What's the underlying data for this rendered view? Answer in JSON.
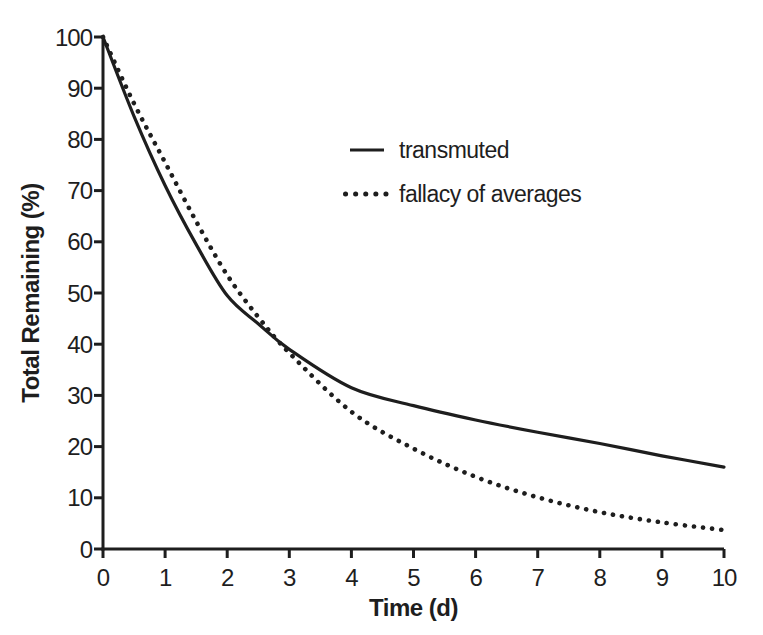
{
  "figure": {
    "background": "#ffffff",
    "ink_color": "#1e1e1e"
  },
  "chart_data": {
    "type": "line",
    "title": "",
    "xlabel": "Time (d)",
    "ylabel": "Total Remaining (%)",
    "xlim": [
      0,
      10
    ],
    "ylim": [
      0,
      100
    ],
    "x_ticks": [
      0,
      1,
      2,
      3,
      4,
      5,
      6,
      7,
      8,
      9,
      10
    ],
    "y_ticks": [
      0,
      10,
      20,
      30,
      40,
      50,
      60,
      70,
      80,
      90,
      100
    ],
    "grid": false,
    "legend_position": "upper-right-inside",
    "series": [
      {
        "name": "transmuted",
        "style": "solid",
        "color": "#1e1e1e",
        "x": [
          0,
          0.5,
          1,
          1.5,
          2,
          2.5,
          3,
          4,
          5,
          6,
          7,
          8,
          9,
          10
        ],
        "y": [
          100,
          84.5,
          71,
          59.5,
          49.5,
          44,
          39,
          31.5,
          28,
          25.2,
          22.8,
          20.6,
          18.2,
          16
        ]
      },
      {
        "name": "fallacy of averages",
        "style": "dotted",
        "color": "#1e1e1e",
        "x": [
          0,
          0.5,
          1,
          1.5,
          2,
          2.5,
          3,
          4,
          5,
          6,
          7,
          8,
          9,
          10
        ],
        "y": [
          100,
          87,
          75.5,
          64,
          53.5,
          45.3,
          38.3,
          26.8,
          19.6,
          14.1,
          10.1,
          7.2,
          5.2,
          3.7
        ]
      }
    ],
    "crossing_point": {
      "x": 2.75,
      "y": 41
    }
  }
}
